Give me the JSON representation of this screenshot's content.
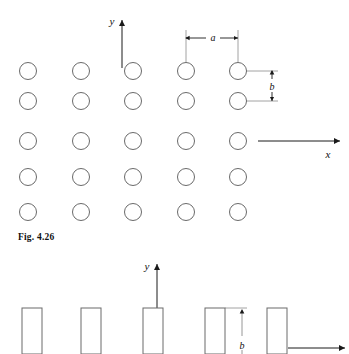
{
  "figure": {
    "caption": "Fig. 4.26",
    "background_color": "#ffffff",
    "shape_stroke_color": "#6a6a6a",
    "axis_color": "#1a1a1a",
    "leader_color": "#8a8a8a"
  },
  "top_figure": {
    "name": "circular-aperture-array",
    "axes": {
      "y_label": "y",
      "x_label": "x",
      "origin_x": 122,
      "origin_y": 141,
      "y_axis_top": 18,
      "x_axis_right": 341
    },
    "dimensions": [
      {
        "label": "a",
        "orientation": "horizontal",
        "from": 186,
        "to": 238,
        "at": 38
      },
      {
        "label": "b",
        "orientation": "vertical",
        "from": 71,
        "to": 101,
        "at": 272
      }
    ],
    "lattice": {
      "columns_x": [
        28,
        81,
        133,
        186,
        238
      ],
      "rows_y": [
        71,
        101,
        141,
        177,
        212
      ],
      "circle_radius": 8.5,
      "count": 25
    }
  },
  "bottom_figure": {
    "name": "rectangular-strip-array",
    "axes": {
      "y_label": "y",
      "x_label": "x",
      "origin_x": 157,
      "origin_y": 352,
      "y_axis_top": 262,
      "x_axis_right": 345
    },
    "dimensions": [
      {
        "label": "b",
        "orientation": "vertical",
        "from": 308,
        "to": 352,
        "at": 242
      }
    ],
    "bars": {
      "left_edges": [
        22,
        81,
        143,
        205,
        267
      ],
      "width": 20,
      "top_y": 308,
      "bottom_y": 354
    }
  },
  "chart_data": {
    "type": "scatter",
    "title": "Fig. 4.26",
    "xlabel": "x",
    "ylabel": "y",
    "series": [
      {
        "name": "circular apertures",
        "x": [
          28,
          81,
          133,
          186,
          238,
          28,
          81,
          133,
          186,
          238,
          28,
          81,
          133,
          186,
          238,
          28,
          81,
          133,
          186,
          238,
          28,
          81,
          133,
          186,
          238
        ],
        "y": [
          71,
          71,
          71,
          71,
          71,
          101,
          101,
          101,
          101,
          101,
          141,
          141,
          141,
          141,
          141,
          177,
          177,
          177,
          177,
          177,
          212,
          212,
          212,
          212,
          212
        ]
      },
      {
        "name": "rectangular strips",
        "x": [
          22,
          81,
          143,
          205,
          267
        ],
        "values": [
          46,
          46,
          46,
          46,
          46
        ]
      }
    ],
    "annotations": [
      "a",
      "b",
      "y",
      "x"
    ],
    "grid": false,
    "legend": "none"
  }
}
